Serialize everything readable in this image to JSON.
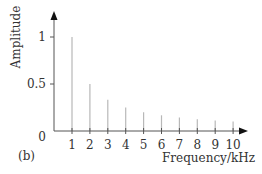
{
  "chart_data": {
    "type": "bar",
    "subtype": "stem",
    "panel_label": "(b)",
    "title": "",
    "xlabel": "Frequency/kHz",
    "ylabel": "Amplitude",
    "categories": [
      "1",
      "2",
      "3",
      "4",
      "5",
      "6",
      "7",
      "8",
      "9",
      "10"
    ],
    "x": [
      1,
      2,
      3,
      4,
      5,
      6,
      7,
      8,
      9,
      10
    ],
    "values": [
      1.0,
      0.5,
      0.333,
      0.25,
      0.2,
      0.167,
      0.143,
      0.125,
      0.111,
      0.1
    ],
    "yticks": [
      "0",
      "0.5",
      "1"
    ],
    "ytick_values": [
      0,
      0.5,
      1
    ],
    "ylim": [
      0,
      1.3
    ],
    "xlim": [
      0,
      10.8
    ],
    "grid": false,
    "legend": null,
    "colors": {
      "stem": "#b8b8b8",
      "axis": "#555555",
      "text": "#333333"
    }
  }
}
